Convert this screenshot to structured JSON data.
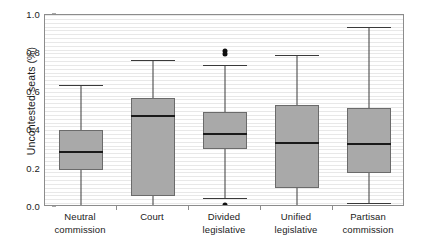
{
  "chart_data": {
    "type": "box",
    "title": "",
    "xlabel": "",
    "ylabel": "Uncontested seats (%)",
    "ylim": [
      0.0,
      1.0
    ],
    "grid": true,
    "grid_interval": 0.02,
    "legend": "none",
    "categories": [
      "Neutral commission",
      "Court",
      "Divided legislative",
      "Unified legislative",
      "Partisan commission"
    ],
    "ytick_labels": [
      "0.0",
      "0.2",
      "0.4",
      "0.6",
      "0.8",
      "1.0"
    ],
    "ytick_values": [
      0.0,
      0.2,
      0.4,
      0.6,
      0.8,
      1.0
    ],
    "boxes": [
      {
        "category": "Neutral commission",
        "label_line1": "Neutral",
        "label_line2": "commission",
        "whisker_low": 0.0,
        "q1": 0.195,
        "median": 0.285,
        "q3": 0.4,
        "whisker_high": 0.635,
        "outliers": []
      },
      {
        "category": "Court",
        "label_line1": "Court",
        "label_line2": "",
        "whisker_low": 0.0,
        "q1": 0.055,
        "median": 0.475,
        "q3": 0.57,
        "whisker_high": 0.765,
        "outliers": []
      },
      {
        "category": "Divided legislative",
        "label_line1": "Divided",
        "label_line2": "legislative",
        "whisker_low": 0.045,
        "q1": 0.3,
        "median": 0.38,
        "q3": 0.495,
        "whisker_high": 0.74,
        "outliers": [
          0.795,
          0.815,
          0.0,
          0.012
        ]
      },
      {
        "category": "Unified legislative",
        "label_line1": "Unified",
        "label_line2": "legislative",
        "whisker_low": 0.0,
        "q1": 0.1,
        "median": 0.335,
        "q3": 0.53,
        "whisker_high": 0.79,
        "outliers": []
      },
      {
        "category": "Partisan commission",
        "label_line1": "Partisan",
        "label_line2": "commission",
        "whisker_low": 0.02,
        "q1": 0.175,
        "median": 0.33,
        "q3": 0.515,
        "whisker_high": 0.935,
        "outliers": []
      }
    ],
    "colors": {
      "box_fill": "#a9a9a9",
      "box_border": "#6b6b6b",
      "median": "#1a1a1a",
      "whisker": "#3a3a3a",
      "outlier": "#101010",
      "gridline": "#e8e8e8",
      "frame": "#8c8c8c",
      "text": "#1a1a1a",
      "background": "#ffffff"
    }
  }
}
